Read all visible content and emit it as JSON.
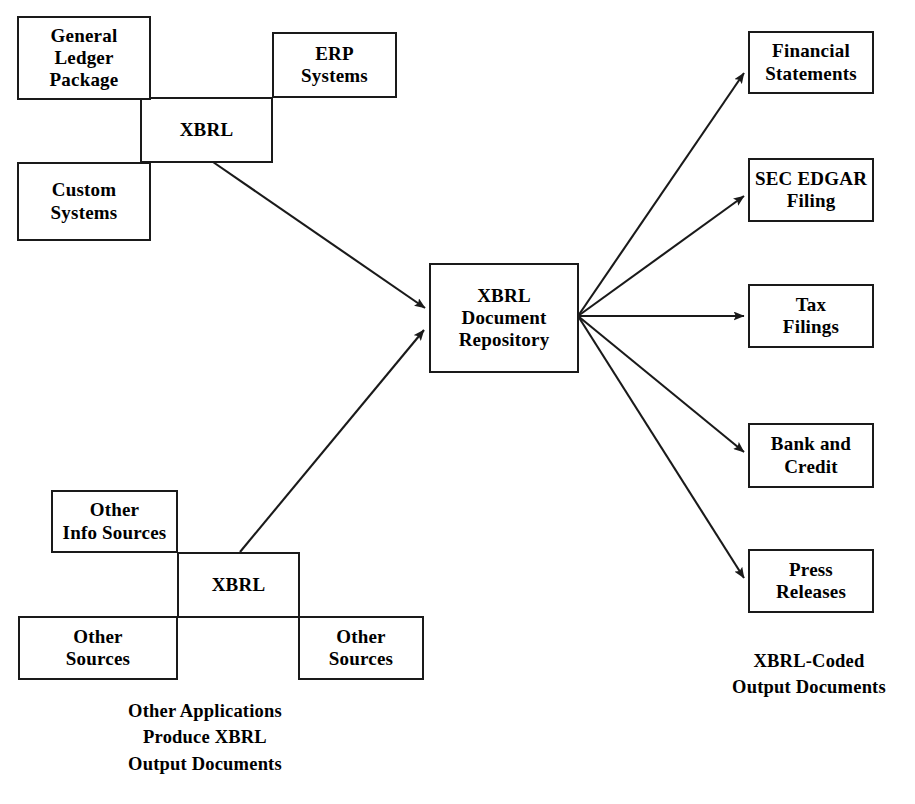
{
  "diagram": {
    "colors": {
      "stroke": "#1a1a1a",
      "background": "#ffffff",
      "text": "#000000"
    },
    "nodes": {
      "general_ledger": {
        "lines": [
          "General",
          "Ledger",
          "Package"
        ]
      },
      "erp_systems": {
        "lines": [
          "ERP",
          "Systems"
        ]
      },
      "custom_systems": {
        "lines": [
          "Custom",
          "Systems"
        ]
      },
      "xbrl_top": {
        "lines": [
          "XBRL"
        ]
      },
      "repository": {
        "lines": [
          "XBRL",
          "Document",
          "Repository"
        ]
      },
      "other_info_sources": {
        "lines": [
          "Other",
          "Info Sources"
        ]
      },
      "xbrl_bottom": {
        "lines": [
          "XBRL"
        ]
      },
      "other_sources_left": {
        "lines": [
          "Other",
          "Sources"
        ]
      },
      "other_sources_right": {
        "lines": [
          "Other",
          "Sources"
        ]
      },
      "financial_statements": {
        "lines": [
          "Financial",
          "Statements"
        ]
      },
      "sec_edgar": {
        "lines": [
          "SEC EDGAR",
          "Filing"
        ]
      },
      "tax_filings": {
        "lines": [
          "Tax",
          "Filings"
        ]
      },
      "bank_credit": {
        "lines": [
          "Bank and",
          "Credit"
        ]
      },
      "press_releases": {
        "lines": [
          "Press",
          "Releases"
        ]
      }
    },
    "captions": {
      "left": {
        "lines": [
          "Other Applications",
          "Produce XBRL",
          "Output Documents"
        ]
      },
      "right": {
        "lines": [
          "XBRL-Coded",
          "Output Documents"
        ]
      }
    },
    "edges": [
      {
        "name": "xbrl-top-to-repository",
        "from": "xbrl_top",
        "to": "repository"
      },
      {
        "name": "xbrl-bottom-to-repository",
        "from": "xbrl_bottom",
        "to": "repository"
      },
      {
        "name": "repository-to-financial-statements",
        "from": "repository",
        "to": "financial_statements"
      },
      {
        "name": "repository-to-sec-edgar",
        "from": "repository",
        "to": "sec_edgar"
      },
      {
        "name": "repository-to-tax-filings",
        "from": "repository",
        "to": "tax_filings"
      },
      {
        "name": "repository-to-bank-credit",
        "from": "repository",
        "to": "bank_credit"
      },
      {
        "name": "repository-to-press-releases",
        "from": "repository",
        "to": "press_releases"
      }
    ]
  }
}
